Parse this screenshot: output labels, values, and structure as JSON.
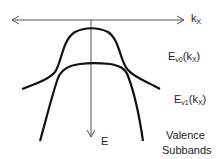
{
  "diagram": {
    "axes": {
      "horizontal": {
        "label_main": "k",
        "label_sub": "X"
      },
      "vertical": {
        "label": "E"
      }
    },
    "curves": [
      {
        "name": "Ev0",
        "label_main": "E",
        "label_sub": "v0",
        "label_arg": "(k",
        "label_arg_sub": "X",
        "label_close": ")"
      },
      {
        "name": "Ev1",
        "label_main": "E",
        "label_sub": "v1",
        "label_arg": "(k",
        "label_arg_sub": "X",
        "label_close": ")"
      }
    ],
    "caption_line1": "Valence",
    "caption_line2": "Subbands",
    "colors": {
      "axis": "#444444",
      "curve": "#111111",
      "text": "#222222"
    }
  }
}
